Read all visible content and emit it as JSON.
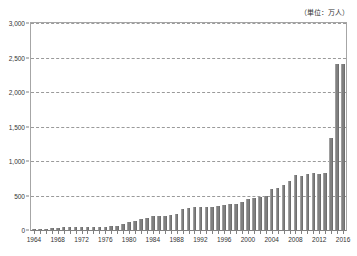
{
  "chart_data": {
    "type": "bar",
    "title": "",
    "subtitle": "",
    "unit_note": "（単位：万人）",
    "xlabel": "",
    "ylabel": "",
    "ylim": [
      0,
      3000
    ],
    "y_ticks": [
      0,
      500,
      1000,
      1500,
      2000,
      2500,
      3000
    ],
    "y_tick_labels": [
      "0",
      "500",
      "1,000",
      "1,500",
      "2,000",
      "2,500",
      "3,000"
    ],
    "grid": true,
    "legend": "none",
    "x_tick_labels": [
      "1964",
      "1968",
      "1972",
      "1976",
      "1980",
      "1984",
      "1988",
      "1992",
      "1996",
      "2000",
      "2004",
      "2008",
      "2012",
      "2016"
    ],
    "bar_color": "#808080",
    "categories": [
      "1964",
      "1965",
      "1966",
      "1967",
      "1968",
      "1969",
      "1970",
      "1971",
      "1972",
      "1973",
      "1974",
      "1975",
      "1976",
      "1977",
      "1978",
      "1979",
      "1980",
      "1981",
      "1982",
      "1983",
      "1984",
      "1985",
      "1986",
      "1987",
      "1988",
      "1989",
      "1990",
      "1991",
      "1992",
      "1993",
      "1994",
      "1995",
      "1996",
      "1997",
      "1998",
      "1999",
      "2000",
      "2001",
      "2002",
      "2003",
      "2004",
      "2005",
      "2006",
      "2007",
      "2008",
      "2009",
      "2010",
      "2011",
      "2012",
      "2013",
      "2014",
      "2015",
      "2016"
    ],
    "values": [
      13,
      17,
      19,
      22,
      34,
      37,
      39,
      40,
      42,
      43,
      45,
      46,
      49,
      58,
      65,
      80,
      117,
      134,
      158,
      181,
      197,
      206,
      196,
      216,
      236,
      305,
      324,
      336,
      339,
      336,
      333,
      341,
      362,
      372,
      384,
      399,
      444,
      459,
      484,
      489,
      588,
      606,
      650,
      715,
      794,
      790,
      815,
      830,
      819,
      832,
      1340,
      2400,
      2400
    ],
    "data_labels_shown": false
  }
}
